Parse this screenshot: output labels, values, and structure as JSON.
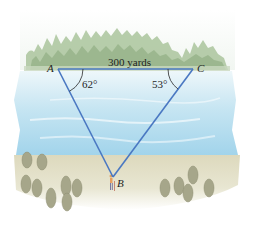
{
  "diagram": {
    "vertices": {
      "A": {
        "label": "A",
        "x": 58,
        "y": 69
      },
      "C": {
        "label": "C",
        "x": 193,
        "y": 69
      },
      "B": {
        "label": "B",
        "x": 113,
        "y": 177
      }
    },
    "side_AC_label": "300 yards",
    "angle_A_label": "62°",
    "angle_C_label": "53°",
    "colors": {
      "triangle_line": "#4a78c2",
      "forest": "#a9c29a",
      "forest_dark": "#8faa80",
      "water_top": "#e4f1f6",
      "water_mid": "#b9def0",
      "water_bottom": "#9fd2ea",
      "ground": "#e2dfc6",
      "shrub": "#a8a88c",
      "text": "#1e1e1e"
    }
  }
}
